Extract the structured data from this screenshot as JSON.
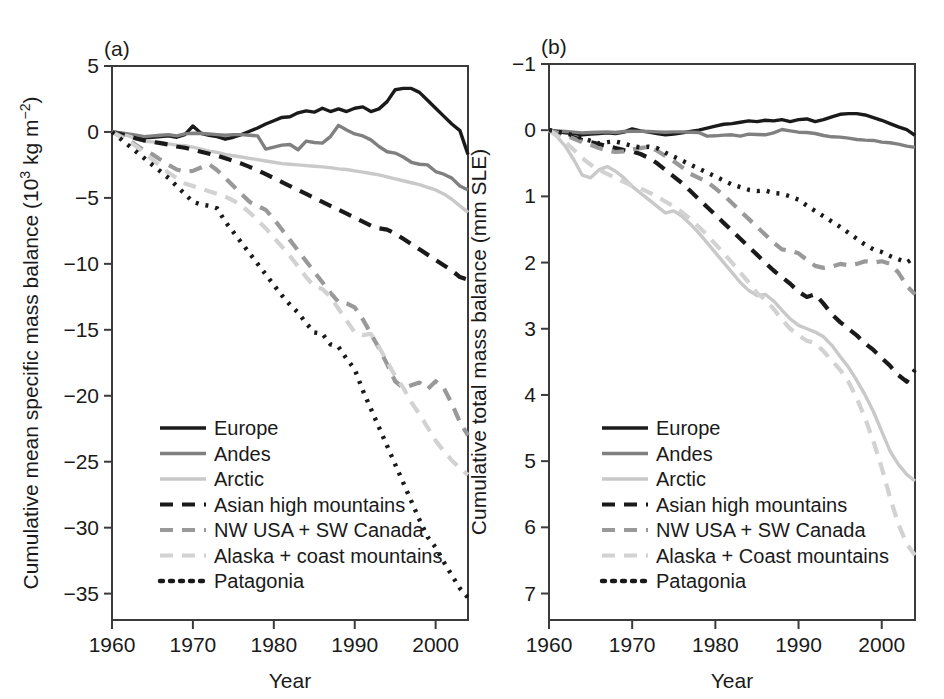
{
  "figure": {
    "panels": [
      {
        "tag": "(a)",
        "xlabel": "Year",
        "ylabel": "Cumulative mean specific mass balance (10³ kg m⁻²)",
        "ylabel_parts": {
          "main": "Cumulative mean specific mass balance (10",
          "sup1": "3",
          "mid": " kg m",
          "sup2": "−2",
          "close": ")"
        },
        "xticks": [
          "1960",
          "1970",
          "1980",
          "1990",
          "2000"
        ],
        "yticks": [
          "5",
          "0",
          "−5",
          "−10",
          "−15",
          "−20",
          "−25",
          "−30",
          "−35"
        ],
        "legend": [
          "Europe",
          "Andes",
          "Arctic",
          "Asian high mountains",
          "NW USA + SW Canada",
          "Alaska + coast mountains",
          "Patagonia"
        ]
      },
      {
        "tag": "(b)",
        "xlabel": "Year",
        "ylabel": "Cumulative total mass balance (mm SLE)",
        "xticks": [
          "1960",
          "1970",
          "1980",
          "1990",
          "2000"
        ],
        "yticks": [
          "−1",
          "0",
          "1",
          "2",
          "3",
          "4",
          "5",
          "6",
          "7"
        ],
        "legend": [
          "Europe",
          "Andes",
          "Arctic",
          "Asian high mountains",
          "NW USA + SW Canada",
          "Alaska + Coast mountains",
          "Patagonia"
        ]
      }
    ]
  },
  "colors": {
    "europe": "#1a1a1a",
    "andes": "#808080",
    "arctic": "#c9c9c9",
    "asian_high_mountains": "#1a1a1a",
    "nw_usa_sw_canada": "#999999",
    "alaska_coast_mountains": "#d2d2d2",
    "patagonia": "#1a1a1a",
    "frame": "#3b3b3b",
    "background": "#ffffff"
  },
  "chart_data": [
    {
      "type": "line",
      "panel": "(a)",
      "title": "",
      "xlabel": "Year",
      "ylabel": "Cumulative mean specific mass balance (10^3 kg m^-2)",
      "xlim": [
        1960,
        2004
      ],
      "ylim": [
        -37,
        5
      ],
      "yticks": [
        5,
        0,
        -5,
        -10,
        -15,
        -20,
        -25,
        -30,
        -35
      ],
      "xticks": [
        1960,
        1970,
        1980,
        1990,
        2000
      ],
      "grid": false,
      "legend_position": "lower-left",
      "x": [
        1960,
        1961,
        1962,
        1963,
        1964,
        1965,
        1966,
        1967,
        1968,
        1969,
        1970,
        1971,
        1972,
        1973,
        1974,
        1975,
        1976,
        1977,
        1978,
        1979,
        1980,
        1981,
        1982,
        1983,
        1984,
        1985,
        1986,
        1987,
        1988,
        1989,
        1990,
        1991,
        1992,
        1993,
        1994,
        1995,
        1996,
        1997,
        1998,
        1999,
        2000,
        2001,
        2002,
        2003,
        2004
      ],
      "series": [
        {
          "name": "Europe",
          "style": "solid",
          "color": "#1a1a1a",
          "values": [
            0,
            -0.1,
            -0.2,
            -0.3,
            -0.45,
            -0.4,
            -0.35,
            -0.3,
            -0.4,
            -0.2,
            0.45,
            -0.1,
            -0.25,
            -0.35,
            -0.55,
            -0.4,
            -0.2,
            0.05,
            0.3,
            0.6,
            0.85,
            1.1,
            1.15,
            1.45,
            1.6,
            1.5,
            1.8,
            1.55,
            1.75,
            1.55,
            1.8,
            1.9,
            1.55,
            1.75,
            2.3,
            3.2,
            3.3,
            3.3,
            3.0,
            2.4,
            1.8,
            1.2,
            0.6,
            0.1,
            -1.7
          ]
        },
        {
          "name": "Andes",
          "style": "solid",
          "color": "#808080",
          "values": [
            0,
            -0.05,
            -0.15,
            -0.25,
            -0.35,
            -0.3,
            -0.25,
            -0.2,
            -0.3,
            -0.15,
            -0.1,
            -0.12,
            -0.15,
            -0.2,
            -0.25,
            -0.2,
            -0.2,
            -0.25,
            -0.3,
            -1.3,
            -1.15,
            -1.0,
            -0.95,
            -1.35,
            -0.7,
            -0.8,
            -0.85,
            -0.35,
            0.5,
            0.15,
            -0.15,
            -0.3,
            -0.6,
            -1.1,
            -1.5,
            -1.6,
            -1.9,
            -2.3,
            -2.45,
            -2.5,
            -3.0,
            -3.2,
            -3.5,
            -4.1,
            -4.4
          ]
        },
        {
          "name": "Arctic",
          "style": "solid",
          "color": "#c9c9c9",
          "values": [
            0,
            -0.15,
            -0.3,
            -0.5,
            -0.7,
            -0.75,
            -0.8,
            -0.9,
            -1.0,
            -1.05,
            -1.15,
            -1.3,
            -1.45,
            -1.55,
            -1.7,
            -1.8,
            -1.9,
            -2.0,
            -2.1,
            -2.2,
            -2.3,
            -2.4,
            -2.45,
            -2.5,
            -2.55,
            -2.6,
            -2.65,
            -2.7,
            -2.8,
            -2.85,
            -2.95,
            -3.05,
            -3.15,
            -3.25,
            -3.4,
            -3.55,
            -3.7,
            -3.85,
            -4.0,
            -4.2,
            -4.4,
            -4.7,
            -5.1,
            -5.6,
            -6.1
          ]
        },
        {
          "name": "Asian high mountains",
          "style": "dashed",
          "color": "#1a1a1a",
          "values": [
            0,
            -0.15,
            -0.3,
            -0.5,
            -0.65,
            -0.75,
            -0.85,
            -0.95,
            -1.1,
            -1.2,
            -1.35,
            -1.5,
            -1.65,
            -1.8,
            -2.0,
            -2.2,
            -2.4,
            -2.65,
            -2.9,
            -3.2,
            -3.5,
            -3.8,
            -4.1,
            -4.4,
            -4.7,
            -5.0,
            -5.3,
            -5.6,
            -5.9,
            -6.2,
            -6.5,
            -6.8,
            -7.1,
            -7.3,
            -7.4,
            -7.7,
            -8.1,
            -8.5,
            -8.9,
            -9.3,
            -9.7,
            -10.1,
            -10.5,
            -11.0,
            -11.2
          ]
        },
        {
          "name": "NW USA + SW Canada",
          "style": "dashed",
          "color": "#999999",
          "values": [
            0,
            -0.3,
            -0.6,
            -1.0,
            -1.4,
            -1.7,
            -2.1,
            -2.5,
            -2.85,
            -3.0,
            -2.95,
            -2.7,
            -2.45,
            -2.9,
            -3.5,
            -4.1,
            -4.7,
            -5.3,
            -5.6,
            -5.9,
            -6.6,
            -7.4,
            -8.2,
            -9.0,
            -9.8,
            -10.6,
            -11.4,
            -12.2,
            -12.9,
            -13.0,
            -13.3,
            -14.2,
            -15.3,
            -16.4,
            -17.6,
            -18.9,
            -19.4,
            -19.2,
            -19.0,
            -19.5,
            -18.9,
            -19.4,
            -20.6,
            -22.0,
            -23.0
          ]
        },
        {
          "name": "Alaska + coast mountains",
          "style": "dashed",
          "color": "#d2d2d2",
          "values": [
            0,
            -0.35,
            -0.7,
            -1.1,
            -1.6,
            -2.1,
            -2.6,
            -3.1,
            -3.5,
            -3.9,
            -4.1,
            -4.3,
            -4.5,
            -4.7,
            -4.9,
            -5.2,
            -5.6,
            -6.1,
            -6.7,
            -7.3,
            -8.0,
            -8.7,
            -9.4,
            -10.2,
            -11.0,
            -11.7,
            -11.9,
            -12.5,
            -13.4,
            -14.3,
            -15.2,
            -15.4,
            -15.3,
            -16.3,
            -17.4,
            -18.5,
            -19.4,
            -20.5,
            -21.4,
            -22.4,
            -23.4,
            -24.2,
            -24.9,
            -25.5,
            -26.0
          ]
        },
        {
          "name": "Patagonia",
          "style": "dotted",
          "color": "#1a1a1a",
          "values": [
            0,
            -0.5,
            -1.0,
            -1.5,
            -2.0,
            -2.5,
            -3.0,
            -3.5,
            -4.1,
            -4.7,
            -5.3,
            -5.5,
            -5.6,
            -5.8,
            -6.8,
            -7.6,
            -8.4,
            -9.2,
            -10.0,
            -10.8,
            -11.6,
            -12.4,
            -13.1,
            -13.7,
            -14.5,
            -15.2,
            -15.3,
            -16.1,
            -16.3,
            -17.2,
            -18.0,
            -19.6,
            -21.0,
            -22.4,
            -23.8,
            -25.2,
            -26.6,
            -28.0,
            -29.4,
            -30.7,
            -31.5,
            -32.6,
            -33.6,
            -34.6,
            -35.3
          ]
        }
      ]
    },
    {
      "type": "line",
      "panel": "(b)",
      "title": "",
      "xlabel": "Year",
      "ylabel": "Cumulative total mass balance (mm SLE)",
      "xlim": [
        1960,
        2004
      ],
      "ylim": [
        -1,
        7.4
      ],
      "y_axis_inverted": true,
      "yticks": [
        -1,
        0,
        1,
        2,
        3,
        4,
        5,
        6,
        7
      ],
      "xticks": [
        1960,
        1970,
        1980,
        1990,
        2000
      ],
      "grid": false,
      "legend_position": "lower-left",
      "x": [
        1960,
        1961,
        1962,
        1963,
        1964,
        1965,
        1966,
        1967,
        1968,
        1969,
        1970,
        1971,
        1972,
        1973,
        1974,
        1975,
        1976,
        1977,
        1978,
        1979,
        1980,
        1981,
        1982,
        1983,
        1984,
        1985,
        1986,
        1987,
        1988,
        1989,
        1990,
        1991,
        1992,
        1993,
        1994,
        1995,
        1996,
        1997,
        1998,
        1999,
        2000,
        2001,
        2002,
        2003,
        2004
      ],
      "series": [
        {
          "name": "Europe",
          "style": "solid",
          "color": "#1a1a1a",
          "values": [
            0,
            0.02,
            0.04,
            0.05,
            0.07,
            0.06,
            0.05,
            0.04,
            0.05,
            0.03,
            -0.02,
            0.01,
            0.03,
            0.05,
            0.07,
            0.06,
            0.04,
            0.02,
            0.0,
            -0.03,
            -0.06,
            -0.09,
            -0.1,
            -0.12,
            -0.14,
            -0.13,
            -0.15,
            -0.14,
            -0.16,
            -0.13,
            -0.16,
            -0.17,
            -0.13,
            -0.16,
            -0.2,
            -0.24,
            -0.25,
            -0.25,
            -0.23,
            -0.19,
            -0.15,
            -0.1,
            -0.05,
            -0.01,
            0.08
          ]
        },
        {
          "name": "Andes",
          "style": "solid",
          "color": "#808080",
          "values": [
            0,
            0.01,
            0.02,
            0.03,
            0.04,
            0.035,
            0.03,
            0.025,
            0.035,
            0.02,
            0.015,
            0.018,
            0.02,
            0.025,
            0.03,
            0.025,
            0.025,
            0.03,
            0.035,
            0.09,
            0.085,
            0.075,
            0.07,
            0.09,
            0.06,
            0.065,
            0.07,
            0.04,
            -0.01,
            0.01,
            0.03,
            0.035,
            0.05,
            0.08,
            0.1,
            0.105,
            0.12,
            0.14,
            0.15,
            0.155,
            0.18,
            0.19,
            0.21,
            0.24,
            0.26
          ]
        },
        {
          "name": "Arctic",
          "style": "solid",
          "color": "#c9c9c9",
          "values": [
            0,
            0.1,
            0.25,
            0.45,
            0.68,
            0.72,
            0.6,
            0.55,
            0.62,
            0.72,
            0.85,
            0.95,
            1.05,
            1.15,
            1.25,
            1.22,
            1.3,
            1.42,
            1.55,
            1.7,
            1.85,
            2.0,
            2.15,
            2.3,
            2.42,
            2.5,
            2.48,
            2.58,
            2.72,
            2.85,
            2.95,
            3.0,
            3.05,
            3.12,
            3.25,
            3.42,
            3.58,
            3.78,
            4.0,
            4.25,
            4.55,
            4.85,
            5.05,
            5.2,
            5.3
          ]
        },
        {
          "name": "Asian high mountains",
          "style": "dashed",
          "color": "#1a1a1a",
          "values": [
            0,
            0.03,
            0.07,
            0.11,
            0.15,
            0.18,
            0.21,
            0.24,
            0.27,
            0.3,
            0.32,
            0.36,
            0.42,
            0.5,
            0.6,
            0.7,
            0.8,
            0.92,
            1.04,
            1.16,
            1.28,
            1.4,
            1.52,
            1.64,
            1.76,
            1.88,
            2.0,
            2.12,
            2.22,
            2.32,
            2.44,
            2.52,
            2.48,
            2.62,
            2.78,
            2.9,
            3.0,
            3.1,
            3.22,
            3.32,
            3.44,
            3.56,
            3.7,
            3.8,
            3.62
          ]
        },
        {
          "name": "NW USA + SW Canada",
          "style": "dashed",
          "color": "#999999",
          "values": [
            0,
            0.04,
            0.08,
            0.13,
            0.18,
            0.22,
            0.27,
            0.31,
            0.33,
            0.32,
            0.29,
            0.27,
            0.25,
            0.31,
            0.39,
            0.47,
            0.56,
            0.66,
            0.72,
            0.78,
            0.88,
            0.98,
            1.1,
            1.22,
            1.34,
            1.46,
            1.58,
            1.7,
            1.8,
            1.82,
            1.86,
            1.96,
            2.05,
            2.08,
            2.06,
            2.02,
            2.04,
            2.02,
            1.98,
            2.0,
            1.98,
            2.02,
            2.15,
            2.35,
            2.48
          ]
        },
        {
          "name": "Alaska + Coast mountains",
          "style": "dashed",
          "color": "#d2d2d2",
          "values": [
            0,
            0.08,
            0.18,
            0.3,
            0.42,
            0.52,
            0.6,
            0.66,
            0.72,
            0.78,
            0.84,
            0.88,
            0.94,
            1.0,
            1.08,
            1.15,
            1.24,
            1.34,
            1.46,
            1.58,
            1.72,
            1.86,
            2.0,
            2.15,
            2.3,
            2.46,
            2.56,
            2.7,
            2.86,
            3.0,
            3.1,
            3.18,
            3.22,
            3.34,
            3.48,
            3.62,
            3.8,
            4.05,
            4.35,
            4.7,
            5.1,
            5.55,
            5.95,
            6.25,
            6.42
          ]
        },
        {
          "name": "Patagonia",
          "style": "dotted",
          "color": "#1a1a1a",
          "values": [
            0,
            0.02,
            0.05,
            0.08,
            0.12,
            0.16,
            0.2,
            0.18,
            0.17,
            0.2,
            0.24,
            0.26,
            0.25,
            0.27,
            0.34,
            0.4,
            0.46,
            0.52,
            0.58,
            0.64,
            0.7,
            0.76,
            0.82,
            0.86,
            0.9,
            0.92,
            0.91,
            0.95,
            0.96,
            1.0,
            1.05,
            1.14,
            1.22,
            1.3,
            1.38,
            1.46,
            1.55,
            1.64,
            1.73,
            1.8,
            1.84,
            1.9,
            1.95,
            2.0,
            1.92
          ]
        }
      ]
    }
  ]
}
